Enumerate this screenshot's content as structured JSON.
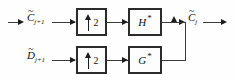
{
  "diagram": {
    "colors": {
      "background": "#fefefe",
      "wire": "#3a3a3a",
      "arrow": "#1c1c1c",
      "block_border": "#2b2b2b",
      "block_fill": "#fdfdfd",
      "text": "#111111"
    },
    "inputs": [
      {
        "id": "input-approx",
        "symbol": "C",
        "accent": "~",
        "subscript": "j+1",
        "full_text": "C̃ j+1"
      },
      {
        "id": "input-detail",
        "symbol": "D",
        "accent": "~",
        "subscript": "j+1",
        "full_text": "D̃ j+1"
      }
    ],
    "outputs": [
      {
        "id": "output-approx",
        "symbol": "C",
        "accent": "~",
        "subscript": "j",
        "full_text": "C̃ j"
      }
    ],
    "blocks": [
      {
        "id": "upsampler-top",
        "type": "upsampler",
        "icon": "up-arrow-icon",
        "factor": "2",
        "row": "top"
      },
      {
        "id": "upsampler-bottom",
        "type": "upsampler",
        "icon": "up-arrow-icon",
        "factor": "2",
        "row": "bottom"
      },
      {
        "id": "filter-h",
        "type": "filter",
        "symbol": "H",
        "superscript": "*",
        "full_text": "H*",
        "row": "top"
      },
      {
        "id": "filter-g",
        "type": "filter",
        "symbol": "G",
        "superscript": "*",
        "full_text": "G*",
        "row": "bottom"
      }
    ],
    "junction": {
      "id": "summing-junction",
      "type": "merge-node",
      "direction": "up"
    }
  }
}
